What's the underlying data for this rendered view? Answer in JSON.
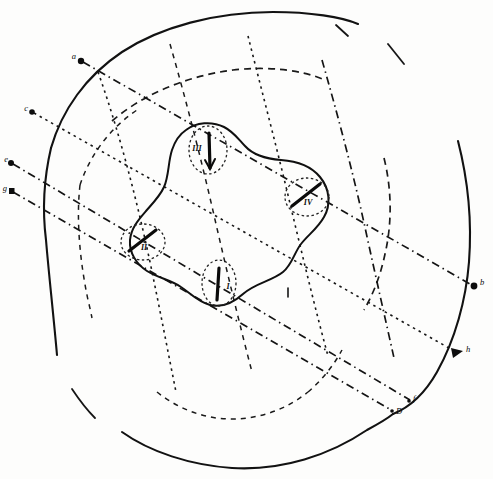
{
  "figure": {
    "background_color": "#fdfdfc",
    "ink_color": "#121212",
    "width": 493,
    "height": 479
  },
  "lobes": [
    {
      "id": "lobe-iii",
      "label": "III",
      "cx": 208,
      "cy": 150,
      "rx": 19,
      "ry": 24,
      "marker": "downward-arrow",
      "label_x": 198,
      "label_y": 150
    },
    {
      "id": "lobe-iv",
      "label": "IV",
      "cx": 307,
      "cy": 198,
      "rx": 22,
      "ry": 19,
      "marker": "diagonal-bar",
      "label_x": 302,
      "label_y": 203
    },
    {
      "id": "lobe-ii",
      "label": "II",
      "cx": 143,
      "cy": 243,
      "rx": 22,
      "ry": 18,
      "marker": "diagonal-bar",
      "label_x": 140,
      "label_y": 248
    },
    {
      "id": "lobe-i",
      "label": "I",
      "cx": 219,
      "cy": 283,
      "rx": 17,
      "ry": 23,
      "marker": "vertical-bar",
      "label_x": 215,
      "label_y": 287
    }
  ],
  "edge_markers": [
    {
      "id": "marker-a",
      "label": "a",
      "shape": "dot",
      "x": 81,
      "y": 61,
      "label_x": 76,
      "label_y": 58
    },
    {
      "id": "marker-c",
      "label": "c",
      "shape": "dot",
      "x": 32,
      "y": 112,
      "label_x": 27,
      "label_y": 110
    },
    {
      "id": "marker-e",
      "label": "e",
      "shape": "dot",
      "x": 11,
      "y": 163,
      "label_x": 6,
      "label_y": 161
    },
    {
      "id": "marker-g",
      "label": "g",
      "shape": "dot",
      "x": 11,
      "y": 191,
      "label_x": 6,
      "label_y": 189
    },
    {
      "id": "marker-b",
      "label": "b",
      "shape": "dot",
      "x": 474,
      "y": 286,
      "label_x": 478,
      "label_y": 284
    },
    {
      "id": "marker-h",
      "label": "h",
      "shape": "triangle",
      "x": 456,
      "y": 352,
      "label_x": 460,
      "label_y": 350
    },
    {
      "id": "marker-f",
      "label": "f",
      "shape": "dot",
      "x": 412,
      "y": 400,
      "label_x": 415,
      "label_y": 398
    },
    {
      "id": "marker-d",
      "label": "D",
      "shape": "dot",
      "x": 394,
      "y": 411,
      "label_x": 398,
      "label_y": 414
    }
  ],
  "line_styles": {
    "outer_contour": "solid",
    "concentric_arcs": "dashed",
    "grid_lines": "dash-dot",
    "vesicle_rings": "dotted"
  }
}
